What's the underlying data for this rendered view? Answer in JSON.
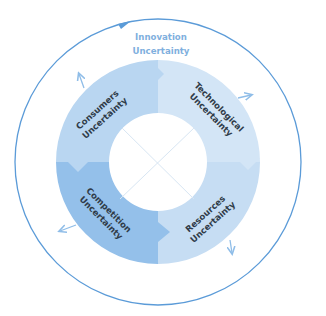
{
  "diagram": {
    "title": {
      "line1": "Innovation",
      "line2": "Uncertainty"
    },
    "segments": [
      {
        "id": "consumers",
        "line1": "Consumers",
        "line2": "Uncertainty",
        "quadrant": "top-left",
        "color": "#b9d6f1"
      },
      {
        "id": "technological",
        "line1": "Technological",
        "line2": "Uncertainty",
        "quadrant": "top-right",
        "color": "#d3e5f6"
      },
      {
        "id": "competition",
        "line1": "Competition",
        "line2": "Uncertainty",
        "quadrant": "bottom-left",
        "color": "#94c0ea"
      },
      {
        "id": "resources",
        "line1": "Resources",
        "line2": "Uncertainty",
        "quadrant": "bottom-right",
        "color": "#c6ddf3"
      }
    ],
    "colors": {
      "outer_circle": "#5b9bd8",
      "title_text": "#7fb0de",
      "label_text": "#2f3b48",
      "arrows": "#8fbde8",
      "center": "#ffffff",
      "cross_lines": "#d8e6f3"
    }
  }
}
